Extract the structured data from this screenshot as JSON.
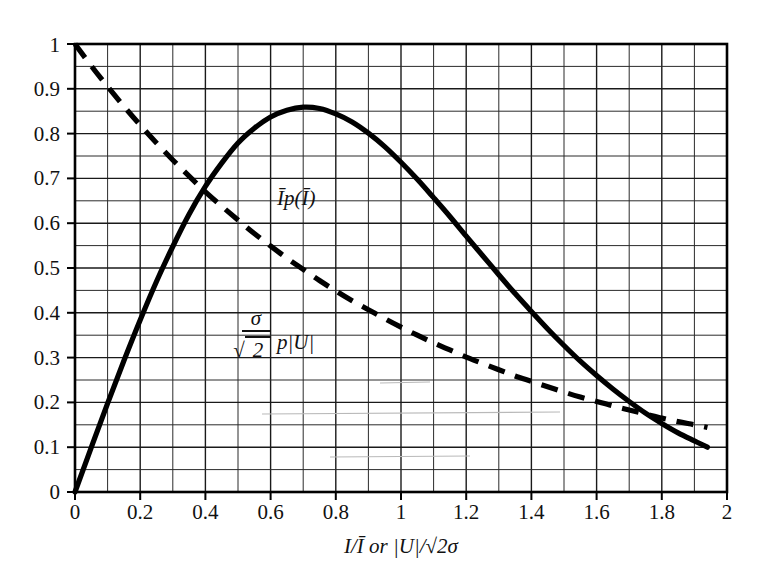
{
  "chart_data": {
    "type": "line",
    "title": "",
    "xlabel": "I/Ī or |U|/√2σ",
    "ylabel": "",
    "xlim": [
      0,
      2
    ],
    "ylim": [
      0,
      1
    ],
    "grid": true,
    "grid_minor_x_step": 0.1,
    "grid_minor_y_step": 0.05,
    "legend_position": "inline-annotations",
    "xticks": [
      "0",
      "0.2",
      "0.4",
      "0.6",
      "0.8",
      "1",
      "1.2",
      "1.4",
      "1.6",
      "1.8",
      "2"
    ],
    "xtick_values": [
      0,
      0.2,
      0.4,
      0.6,
      0.8,
      1,
      1.2,
      1.4,
      1.6,
      1.8,
      2
    ],
    "yticks": [
      "0",
      "0.1",
      "0.2",
      "0.3",
      "0.4",
      "0.5",
      "0.6",
      "0.7",
      "0.8",
      "0.9",
      "1"
    ],
    "ytick_values": [
      0,
      0.1,
      0.2,
      0.3,
      0.4,
      0.5,
      0.6,
      0.7,
      0.8,
      0.9,
      1
    ],
    "x": [
      0,
      0.05,
      0.1,
      0.15,
      0.2,
      0.25,
      0.3,
      0.35,
      0.4,
      0.45,
      0.5,
      0.55,
      0.6,
      0.65,
      0.7,
      0.75,
      0.8,
      0.85,
      0.9,
      0.95,
      1,
      1.05,
      1.1,
      1.15,
      1.2,
      1.25,
      1.3,
      1.35,
      1.4,
      1.45,
      1.5,
      1.55,
      1.6,
      1.65,
      1.7,
      1.75,
      1.8,
      1.85,
      1.9,
      1.94
    ],
    "series": [
      {
        "name": "Īp(Ī)",
        "style": "dashed",
        "color": "#000000",
        "formula": "exp(-x)",
        "values": [
          1.0,
          0.951,
          0.905,
          0.861,
          0.819,
          0.779,
          0.741,
          0.705,
          0.67,
          0.638,
          0.607,
          0.577,
          0.549,
          0.522,
          0.497,
          0.472,
          0.449,
          0.427,
          0.407,
          0.387,
          0.368,
          0.35,
          0.333,
          0.317,
          0.301,
          0.287,
          0.273,
          0.259,
          0.247,
          0.235,
          0.223,
          0.212,
          0.202,
          0.192,
          0.183,
          0.174,
          0.165,
          0.157,
          0.15,
          0.144
        ]
      },
      {
        "name": "σ/√2 p|U|",
        "style": "solid",
        "color": "#000000",
        "formula": "2x*exp(-x^2)",
        "values": [
          0.0,
          0.0997,
          0.198,
          0.293,
          0.384,
          0.47,
          0.548,
          0.62,
          0.682,
          0.734,
          0.779,
          0.812,
          0.837,
          0.852,
          0.859,
          0.856,
          0.844,
          0.826,
          0.801,
          0.771,
          0.736,
          0.698,
          0.657,
          0.615,
          0.571,
          0.528,
          0.485,
          0.443,
          0.403,
          0.364,
          0.327,
          0.292,
          0.26,
          0.23,
          0.202,
          0.176,
          0.153,
          0.132,
          0.114,
          0.1
        ]
      }
    ],
    "annotations": [
      {
        "name": "dashed-curve-label",
        "text": "Īp(Ī)",
        "x": 0.62,
        "y": 0.645
      },
      {
        "name": "solid-curve-label",
        "numerator": "σ",
        "denominator": "2",
        "radical": "√",
        "suffix": "p|U|",
        "x": 0.52,
        "y": 0.345
      }
    ],
    "curve_notes": {
      "solid_peak_x": 0.71,
      "solid_peak_y": 0.428,
      "crossover_x": 1.2,
      "crossover_y": 0.3,
      "x_end": 1.94,
      "solid_end_y": 0.04,
      "dashed_end_y": 0.14
    }
  },
  "axis": {
    "x_title_parts": {
      "symbol1": "I/Ī",
      "conjunction": "or",
      "symbol2": "|U|/√2σ"
    }
  }
}
